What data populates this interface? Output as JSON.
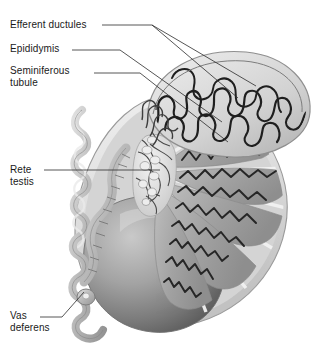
{
  "figure": {
    "background_color": "#ffffff",
    "width": 324,
    "height": 356,
    "style": "grayscale medical illustration"
  },
  "labels": [
    {
      "id": "efferent-ductules",
      "text": "Efferent ductules",
      "x": 10,
      "y": 19,
      "leader": "two branching lines to upper right"
    },
    {
      "id": "epididymis",
      "text": "Epididymis",
      "x": 10,
      "y": 43,
      "leader": "single line to epididymal head"
    },
    {
      "id": "seminiferous-tubule",
      "text": "Seminiferous\ntubule",
      "x": 10,
      "y": 65,
      "leader": "single line to tubule in lobule"
    },
    {
      "id": "rete-testis",
      "text": "Rete\ntestis",
      "x": 10,
      "y": 164,
      "leader": "horizontal line to mediastinum"
    },
    {
      "id": "vas-deferens",
      "text": "Vas\ndeferens",
      "x": 10,
      "y": 310,
      "leader": "diagonal line up-right to duct end"
    }
  ],
  "structures": {
    "tunica_albuginea": "outer pale capsule band",
    "testis_body": "shaded gray ovoid, intact anterior surface",
    "lobules": "wedge-shaped gray compartments containing coiled tubules",
    "septa": "pale radiating partitions between lobules",
    "mediastinum_testis": "central network of rete testis channels",
    "epididymis_head": "convoluted duct mass over superior pole",
    "vas_deferens": "coiled tube ascending at left"
  },
  "colors": {
    "line": "#1a1a1a",
    "leader": "#2b2b2b",
    "capsule_light": "#e8e8e8",
    "capsule_mid": "#cfcfcf",
    "lobule_gray": "#a8a8a8",
    "lobule_dark": "#8d8d8d",
    "body_shade_light": "#bdbdbd",
    "body_shade_dark": "#5c5c5c",
    "duct_light": "#d6d6d6",
    "duct_mid": "#9e9e9e",
    "background": "#ffffff"
  }
}
